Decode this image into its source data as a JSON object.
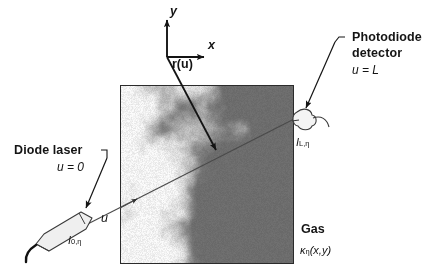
{
  "figure": {
    "title_absent": true,
    "axes": {
      "x_label": "x",
      "y_label": "y"
    },
    "vector_label": "r(u)",
    "source": {
      "name": "Diode laser",
      "position_label": "u = 0",
      "intensity_symbol": "I",
      "intensity_sub": "0,η"
    },
    "detector": {
      "name_line1": "Photodiode",
      "name_line2": "detector",
      "position_label": "u = L",
      "intensity_symbol": "I",
      "intensity_sub": "L,η"
    },
    "medium": {
      "name": "Gas",
      "property_symbol": "κ",
      "property_sub": "η",
      "property_args": "(x,y)"
    },
    "beam_param_label": "u",
    "colors": {
      "ink": "#141414",
      "field_border": "#2b2b2b",
      "field_dark": "#6d6d6d",
      "field_light": "#ededed",
      "beam": "#3a3a3a"
    }
  }
}
